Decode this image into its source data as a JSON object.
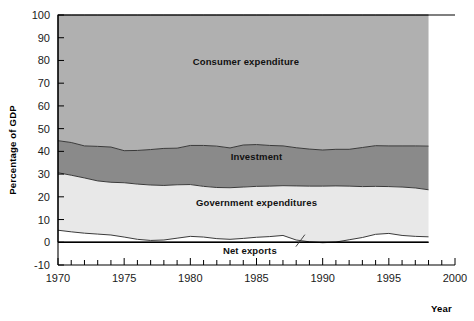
{
  "chart_data": {
    "type": "area",
    "title": "",
    "subtitle": "",
    "xlabel": "Year",
    "ylabel": "Percentage of GDP",
    "xlim": [
      1970,
      2000
    ],
    "ylim": [
      -10,
      100
    ],
    "ytick_labels": [
      "100",
      "90",
      "80",
      "70",
      "60",
      "50",
      "40",
      "30",
      "20",
      "10",
      "0",
      "-10"
    ],
    "ytick_values": [
      100,
      90,
      80,
      70,
      60,
      50,
      40,
      30,
      20,
      10,
      0,
      -10
    ],
    "xtick_labels": [
      "1970",
      "1975",
      "1980",
      "1985",
      "1990",
      "1995",
      "2000"
    ],
    "xtick_values": [
      1970,
      1975,
      1980,
      1985,
      1990,
      1995,
      2000
    ],
    "minor_xtick_step": 1,
    "grid": false,
    "legend_position": "inline-annotations",
    "stacked": true,
    "x": [
      1970,
      1971,
      1972,
      1973,
      1974,
      1975,
      1976,
      1977,
      1978,
      1979,
      1980,
      1981,
      1982,
      1983,
      1984,
      1985,
      1986,
      1987,
      1988,
      1989,
      1990,
      1991,
      1992,
      1993,
      1994,
      1995,
      1996,
      1997,
      1998
    ],
    "series": [
      {
        "name": "Net exports",
        "color": "#ffffff",
        "values": [
          5.3,
          4.6,
          4.0,
          3.6,
          3.2,
          2.3,
          1.3,
          0.8,
          1.0,
          1.8,
          2.6,
          2.3,
          1.6,
          1.3,
          1.7,
          2.2,
          2.5,
          3.0,
          1.0,
          0.2,
          -0.2,
          0.1,
          1.1,
          2.1,
          3.5,
          3.9,
          3.0,
          2.6,
          2.4
        ]
      },
      {
        "name": "Government expenditures",
        "color": "#e8e8e8",
        "values": [
          25.3,
          24.9,
          24.3,
          23.4,
          23.2,
          23.9,
          24.3,
          24.4,
          24.0,
          23.5,
          22.8,
          22.3,
          22.5,
          22.7,
          22.6,
          22.4,
          22.2,
          21.9,
          23.8,
          24.5,
          24.9,
          24.7,
          23.6,
          22.4,
          21.1,
          20.6,
          21.3,
          21.3,
          20.7
        ]
      },
      {
        "name": "Investment",
        "color": "#8a8a8a",
        "values": [
          14.1,
          14.4,
          14.1,
          15.2,
          15.5,
          14.1,
          14.8,
          15.6,
          16.3,
          16.1,
          17.2,
          18.0,
          18.2,
          17.5,
          18.5,
          18.4,
          17.9,
          17.5,
          16.8,
          16.3,
          15.9,
          16.1,
          16.2,
          17.2,
          17.9,
          17.9,
          18.1,
          18.5,
          19.2
        ]
      },
      {
        "name": "Consumer expenditure",
        "color": "#b0b0b0",
        "values": [
          55.3,
          56.1,
          57.6,
          57.8,
          58.1,
          59.7,
          59.6,
          59.2,
          58.7,
          58.6,
          57.4,
          57.4,
          57.7,
          58.5,
          57.2,
          57.0,
          57.4,
          57.6,
          58.4,
          59.0,
          59.4,
          59.1,
          59.1,
          58.3,
          57.5,
          57.6,
          57.6,
          57.6,
          57.7
        ]
      }
    ],
    "annotations": [
      {
        "text": "Consumer expenditure",
        "x": 1984.2,
        "y": 78
      },
      {
        "text": "Investment",
        "x": 1985.0,
        "y": 36
      },
      {
        "text": "Government expenditures",
        "x": 1985.0,
        "y": 16
      },
      {
        "text": "Net exports",
        "x": 1984.5,
        "y": -5
      }
    ]
  }
}
